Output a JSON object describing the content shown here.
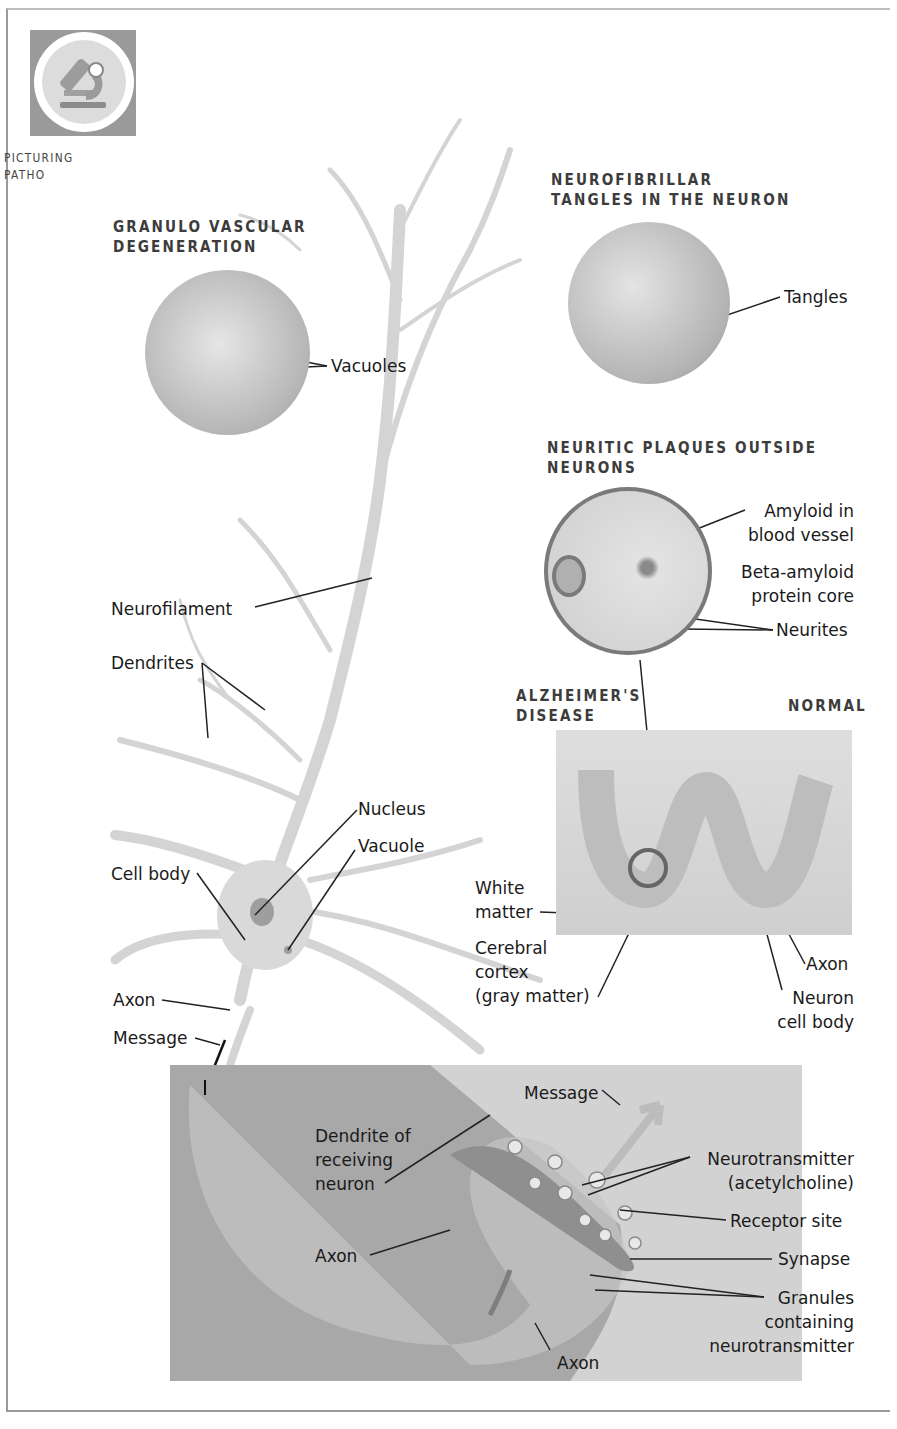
{
  "figure": {
    "badge": {
      "line1": "PICTURING",
      "line2": "PATHO",
      "icon": "microscope-icon"
    },
    "headings": {
      "granulo_line1": "GRANULO VASCULAR",
      "granulo_line2": "DEGENERATION",
      "tangles_line1": "NEUROFIBRILLAR",
      "tangles_line2": "TANGLES IN THE NEURON",
      "plaques_line1": "NEURITIC PLAQUES OUTSIDE",
      "plaques_line2": "NEURONS",
      "alz_line1": "ALZHEIMER'S",
      "alz_line2": "DISEASE",
      "normal": "NORMAL"
    },
    "labels": {
      "vacuoles": "Vacuoles",
      "tangles": "Tangles",
      "amyloid_1": "Amyloid in",
      "amyloid_2": "blood vessel",
      "beta_1": "Beta-amyloid",
      "beta_2": "protein core",
      "neurites": "Neurites",
      "neurofilament": "Neurofilament",
      "dendrites": "Dendrites",
      "nucleus": "Nucleus",
      "vacuole": "Vacuole",
      "cell_body": "Cell body",
      "axon_left": "Axon",
      "message_left": "Message",
      "white_1": "White",
      "white_2": "matter",
      "cortex_1": "Cerebral",
      "cortex_2": "cortex",
      "cortex_3": "(gray matter)",
      "axon_cortex": "Axon",
      "neuron_cb_1": "Neuron",
      "neuron_cb_2": "cell body",
      "message_syn": "Message",
      "dendrite_rx_1": "Dendrite of",
      "dendrite_rx_2": "receiving",
      "dendrite_rx_3": "neuron",
      "nt_1": "Neurotransmitter",
      "nt_2": "(acetylcholine)",
      "receptor": "Receptor site",
      "synapse": "Synapse",
      "granules_1": "Granules",
      "granules_2": "containing",
      "granules_3": "neurotransmitter",
      "axon_syn_mid": "Axon",
      "axon_syn_bottom": "Axon"
    },
    "colors": {
      "frame": "#9a9a9a",
      "heading": "#3c3c3c",
      "synapse_bg": "#a8a8a8",
      "neuron": "#d8d8d8"
    }
  }
}
